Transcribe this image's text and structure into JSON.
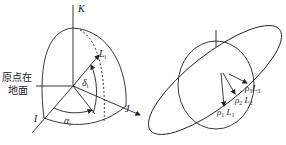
{
  "left_figure": {
    "axis_k": "K",
    "axis_i": "I",
    "axis_j": "J",
    "vector_label": "L",
    "vector_sub": "i",
    "elevation_label": "δ",
    "elevation_sub": "i",
    "azimuth_label": "α",
    "azimuth_sub": "i",
    "origin_note_line1": "原点在",
    "origin_note_line2": "地面"
  },
  "right_figure": {
    "labels": [
      {
        "rho": "ρ",
        "rho_sub": "1",
        "L": "L",
        "L_sub": "1"
      },
      {
        "rho": "ρ",
        "rho_sub": "2",
        "L": "L",
        "L_sub": "2"
      },
      {
        "rho": "ρ",
        "rho_sub": "3",
        "L": "L",
        "L_sub": "3"
      }
    ]
  }
}
